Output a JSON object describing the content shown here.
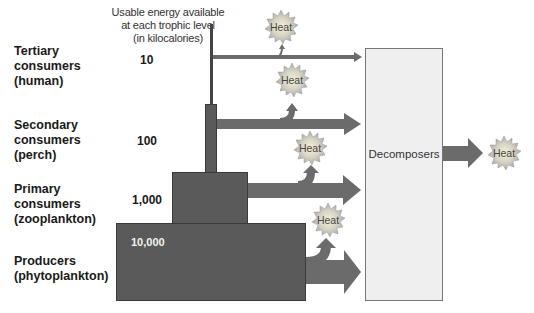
{
  "header": {
    "line1": "Usable energy available",
    "line2": "at each trophic level",
    "line3": "(in kilocalories)"
  },
  "levels": [
    {
      "name": "Tertiary\nconsumers\n(human)",
      "energy": "10"
    },
    {
      "name": "Secondary\nconsumers\n(perch)",
      "energy": "100"
    },
    {
      "name": "Primary\nconsumers\n(zooplankton)",
      "energy": "1,000"
    },
    {
      "name": "Producers\n(phytoplankton)",
      "energy": "10,000"
    }
  ],
  "decomposers": {
    "label": "Decomposers"
  },
  "heat_label": "Heat",
  "colors": {
    "block": "#5a5a5a",
    "arrow": "#666666",
    "decomposer_fill": "#efefef",
    "heat_burst": "#b8b8b8",
    "heat_center": "#f4f0d8"
  }
}
